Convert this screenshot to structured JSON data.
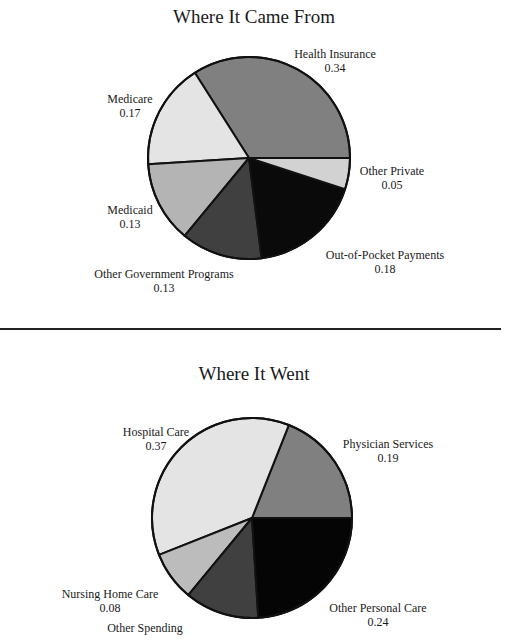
{
  "chart_data": [
    {
      "type": "pie",
      "title": "Where It Came From",
      "center": [
        249,
        158
      ],
      "radius": 101,
      "start_angle_deg": 0,
      "direction": "counterclockwise",
      "categories": [
        "Health Insurance",
        "Medicare",
        "Medicaid",
        "Other Government Programs",
        "Out-of-Pocket Payments",
        "Other Private"
      ],
      "values": [
        0.34,
        0.17,
        0.13,
        0.13,
        0.18,
        0.05
      ],
      "value_labels": [
        "0.34",
        "0.17",
        "0.13",
        "0.13",
        "0.18",
        "0.05"
      ],
      "colors": [
        "#808080",
        "#e4e4e4",
        "#b4b4b4",
        "#404040",
        "#0a0a0a",
        "#d2d2d2"
      ],
      "label_positions": [
        [
          335,
          47
        ],
        [
          130,
          92
        ],
        [
          130,
          203
        ],
        [
          164,
          267
        ],
        [
          385,
          248
        ],
        [
          392,
          164
        ]
      ]
    },
    {
      "type": "pie",
      "title": "Where It Went",
      "center": [
        252,
        518
      ],
      "radius": 100,
      "start_angle_deg": 0,
      "direction": "counterclockwise",
      "categories": [
        "Physician Services",
        "Hospital Care",
        "Nursing Home Care",
        "Other Spending",
        "Other Personal Care"
      ],
      "values": [
        0.19,
        0.37,
        0.08,
        0.12,
        0.24
      ],
      "value_labels": [
        "0.19",
        "0.37",
        "0.08",
        "",
        "0.24"
      ],
      "colors": [
        "#808080",
        "#e4e4e4",
        "#bcbcbc",
        "#404040",
        "#050505"
      ],
      "label_positions": [
        [
          388,
          437
        ],
        [
          156,
          425
        ],
        [
          110,
          587
        ],
        [
          145,
          621
        ],
        [
          378,
          601
        ]
      ]
    }
  ]
}
